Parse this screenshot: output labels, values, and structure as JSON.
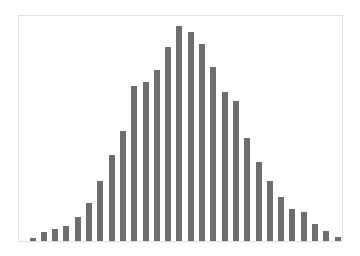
{
  "chart_data": {
    "type": "bar",
    "title": "",
    "xlabel": "",
    "ylabel": "",
    "grid": false,
    "legend": null,
    "bar_color": "#6e6e6e",
    "frame_color": "#e2e2e2",
    "categories": [
      1,
      2,
      3,
      4,
      5,
      6,
      7,
      8,
      9,
      10,
      11,
      12,
      13,
      14,
      15,
      16,
      17,
      18,
      19,
      20,
      21,
      22,
      23,
      24,
      25,
      26,
      27,
      28
    ],
    "values": [
      3,
      9,
      12,
      15,
      24,
      38,
      60,
      86,
      110,
      155,
      159,
      171,
      194,
      215,
      209,
      197,
      174,
      149,
      140,
      103,
      79,
      60,
      44,
      32,
      29,
      17,
      10,
      4
    ],
    "ylim": [
      0,
      227
    ],
    "layout": {
      "baseline_y": 241,
      "first_bar_center_x": 32.5,
      "bar_step": 11.3,
      "bar_width": 6
    }
  }
}
